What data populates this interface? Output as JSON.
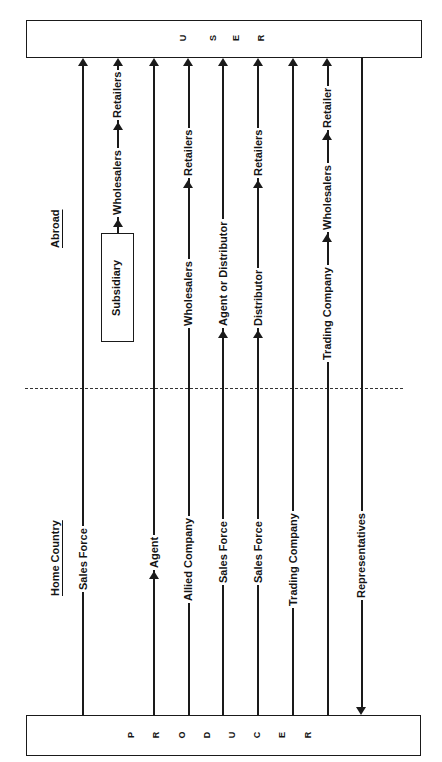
{
  "diagram": {
    "top_box": {
      "label": "USER",
      "letters": [
        "U",
        "S",
        "E",
        "R"
      ]
    },
    "bottom_box": {
      "label": "PRODUCER",
      "letters": [
        "P",
        "R",
        "O",
        "D",
        "U",
        "C",
        "E",
        "R"
      ]
    },
    "regions": {
      "home": "Home Country",
      "abroad": "Abroad"
    },
    "channels": [
      {
        "id": 1,
        "home": [
          "Sales Force"
        ],
        "abroad": []
      },
      {
        "id": 2,
        "home": [],
        "abroad": [
          "Subsidiary",
          "Wholesalers",
          "Retailers"
        ]
      },
      {
        "id": 3,
        "home": [
          "Agent"
        ],
        "abroad": []
      },
      {
        "id": 4,
        "home": [
          "Allied Company"
        ],
        "abroad": [
          "Wholesalers",
          "Retailers"
        ]
      },
      {
        "id": 5,
        "home": [
          "Sales Force"
        ],
        "abroad": [
          "Agent or Distributor"
        ]
      },
      {
        "id": 6,
        "home": [
          "Sales Force"
        ],
        "abroad": [
          "Distributor",
          "Retailers"
        ]
      },
      {
        "id": 7,
        "home": [
          "Trading Company"
        ],
        "abroad": []
      },
      {
        "id": 8,
        "home": [],
        "abroad": [
          "Trading Company",
          "Wholesalers",
          "Retailer"
        ]
      },
      {
        "id": 9,
        "home": [
          "Representatives"
        ],
        "abroad": [],
        "direction": "user-to-producer"
      }
    ],
    "labels": {
      "c1_sales_force": "Sales Force",
      "c2_subsidiary": "Subsidiary",
      "c2_wholesalers": "Wholesalers",
      "c2_retailers": "Retailers",
      "c3_agent": "Agent",
      "c4_allied": "Allied Company",
      "c4_wholesalers": "Wholesalers",
      "c4_retailers": "Retailers",
      "c5_sales_force": "Sales Force",
      "c5_agent_dist": "Agent or Distributor",
      "c6_sales_force": "Sales Force",
      "c6_distributor": "Distributor",
      "c6_retailers": "Retailers",
      "c7_trading": "Trading Company",
      "c8_trading": "Trading Company",
      "c8_wholesalers": "Wholesalers",
      "c8_retailer": "Retailer",
      "c9_reps": "Representatives"
    }
  }
}
